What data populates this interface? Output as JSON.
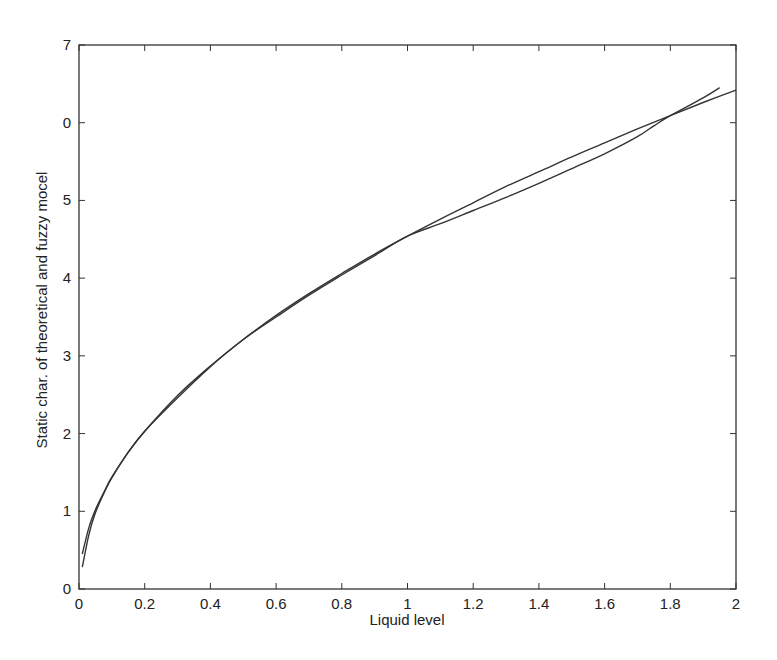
{
  "chart_data": {
    "type": "line",
    "title": "",
    "xlabel": "Liquid level",
    "ylabel": "Static char. of theoretical and fuzzy mocel",
    "xlim": [
      0,
      2
    ],
    "ylim": [
      0,
      7
    ],
    "grid": false,
    "legend": null,
    "x_ticks": [
      0,
      0.2,
      0.4,
      0.6,
      0.8,
      1,
      1.2,
      1.4,
      1.6,
      1.8,
      2
    ],
    "x_tick_labels": [
      "0",
      "0.2",
      "0.4",
      "0.6",
      "0.8",
      "1",
      "1.2",
      "1.4",
      "1.6",
      "1.8",
      "2"
    ],
    "y_ticks": [
      0,
      1,
      2,
      3,
      4,
      5,
      6,
      7
    ],
    "y_tick_labels": [
      "0",
      "1",
      "2",
      "3",
      "4",
      "5",
      "0",
      "7"
    ],
    "series": [
      {
        "name": "Theoretical",
        "color": "#333333",
        "x": [
          0.01,
          0.03,
          0.05,
          0.08,
          0.1,
          0.15,
          0.2,
          0.3,
          0.4,
          0.5,
          0.6,
          0.7,
          0.8,
          0.9,
          1.0,
          1.1,
          1.2,
          1.3,
          1.4,
          1.5,
          1.6,
          1.7,
          1.8,
          1.9,
          2.0
        ],
        "y": [
          0.45,
          0.79,
          1.02,
          1.28,
          1.44,
          1.76,
          2.03,
          2.49,
          2.87,
          3.21,
          3.52,
          3.8,
          4.06,
          4.31,
          4.54,
          4.76,
          4.97,
          5.18,
          5.37,
          5.56,
          5.74,
          5.92,
          6.09,
          6.26,
          6.42
        ]
      },
      {
        "name": "Fuzzy model",
        "color": "#333333",
        "x": [
          0.01,
          0.03,
          0.05,
          0.08,
          0.1,
          0.15,
          0.2,
          0.3,
          0.4,
          0.5,
          0.6,
          0.7,
          0.8,
          0.9,
          1.0,
          1.1,
          1.2,
          1.3,
          1.4,
          1.5,
          1.6,
          1.7,
          1.75,
          1.8,
          1.9,
          1.95
        ],
        "y": [
          0.28,
          0.7,
          0.98,
          1.27,
          1.43,
          1.76,
          2.03,
          2.46,
          2.86,
          3.21,
          3.5,
          3.78,
          4.04,
          4.29,
          4.54,
          4.7,
          4.87,
          5.04,
          5.22,
          5.41,
          5.6,
          5.82,
          5.96,
          6.09,
          6.32,
          6.45
        ]
      }
    ]
  }
}
